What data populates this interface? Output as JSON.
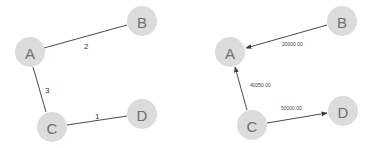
{
  "left_graph": {
    "nodes": [
      {
        "id": "A",
        "label": "A"
      },
      {
        "id": "B",
        "label": "B"
      },
      {
        "id": "C",
        "label": "C"
      },
      {
        "id": "D",
        "label": "D"
      }
    ],
    "edges": [
      {
        "from": "A",
        "to": "B",
        "label": "2"
      },
      {
        "from": "A",
        "to": "C",
        "label": "3"
      },
      {
        "from": "C",
        "to": "D",
        "label": "1"
      }
    ]
  },
  "right_graph": {
    "nodes": [
      {
        "id": "A",
        "label": "A"
      },
      {
        "id": "B",
        "label": "B"
      },
      {
        "id": "C",
        "label": "C"
      },
      {
        "id": "D",
        "label": "D"
      }
    ],
    "edges": [
      {
        "from": "B",
        "to": "A",
        "label": "20000.00",
        "directed": true
      },
      {
        "from": "C",
        "to": "A",
        "label": "40050.00",
        "directed": true
      },
      {
        "from": "C",
        "to": "D",
        "label": "50000.00",
        "directed": true
      }
    ]
  }
}
